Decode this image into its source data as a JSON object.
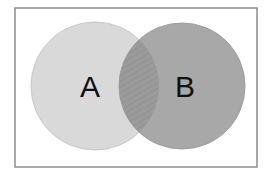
{
  "diagram": {
    "type": "venn",
    "frame": {
      "x": 15,
      "y": 8,
      "width": 242,
      "height": 159,
      "stroke": "#8c8c8c",
      "fill": "#ffffff"
    },
    "sets": [
      {
        "id": "A",
        "label": "A",
        "cx": 95,
        "cy": 86,
        "r": 64,
        "fill": "#d9d9d9",
        "stroke": "#c8c8c8"
      },
      {
        "id": "B",
        "label": "B",
        "cx": 182,
        "cy": 86,
        "r": 63,
        "fill": "#a8a8a8",
        "stroke": "#9c9c9c"
      }
    ],
    "intersection": {
      "label": "A ∩ B",
      "fill": "#9b9b9b",
      "hatch_color": "#8a8a8a",
      "pattern": "diagonal-hatch"
    }
  }
}
